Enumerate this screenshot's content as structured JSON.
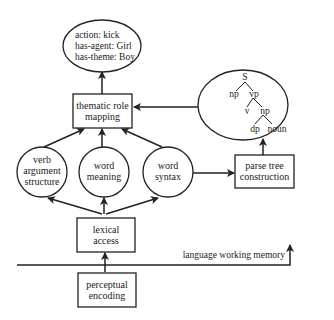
{
  "diagram": {
    "nodes": {
      "output_frame": {
        "lines": [
          "action: kick",
          "has-agent: Girl",
          "has-theme: Boy"
        ]
      },
      "thematic_role_mapping": {
        "lines": [
          "thematic role",
          "mapping"
        ]
      },
      "parse_tree": {
        "root": "S",
        "labels": [
          "S",
          "np",
          "vp",
          "v",
          "np",
          "dp",
          "noun"
        ]
      },
      "verb_argument_structure": {
        "lines": [
          "verb",
          "argument",
          "structure"
        ]
      },
      "word_meaning": {
        "lines": [
          "word",
          "meaning"
        ]
      },
      "word_syntax": {
        "lines": [
          "word",
          "syntax"
        ]
      },
      "parse_tree_construction": {
        "lines": [
          "parse tree",
          "construction"
        ]
      },
      "lexical_access": {
        "lines": [
          "lexical",
          "access"
        ]
      },
      "perceptual_encoding": {
        "lines": [
          "perceptual",
          "encoding"
        ]
      }
    },
    "memory_label": "language working memory",
    "edges": [
      [
        "perceptual_encoding",
        "lexical_access"
      ],
      [
        "lexical_access",
        "verb_argument_structure"
      ],
      [
        "lexical_access",
        "word_meaning"
      ],
      [
        "lexical_access",
        "word_syntax"
      ],
      [
        "verb_argument_structure",
        "thematic_role_mapping"
      ],
      [
        "word_meaning",
        "thematic_role_mapping"
      ],
      [
        "word_syntax",
        "thematic_role_mapping"
      ],
      [
        "word_syntax",
        "parse_tree_construction"
      ],
      [
        "parse_tree_construction",
        "parse_tree"
      ],
      [
        "parse_tree",
        "thematic_role_mapping"
      ],
      [
        "thematic_role_mapping",
        "output_frame"
      ]
    ]
  }
}
